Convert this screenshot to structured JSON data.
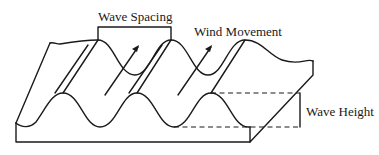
{
  "diagram": {
    "labels": {
      "wave_spacing": "Wave Spacing",
      "wind_movement": "Wind Movement",
      "wave_height": "Wave Height"
    },
    "colors": {
      "line": "#1a1a1a",
      "background": "#ffffff"
    }
  }
}
